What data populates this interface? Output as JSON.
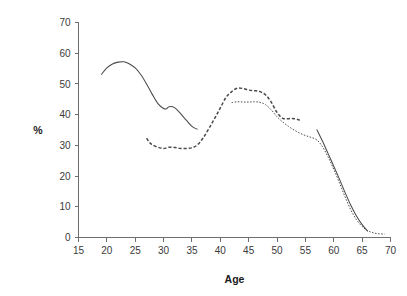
{
  "chart_data": {
    "type": "line",
    "title": "",
    "xlabel": "Age",
    "ylabel": "%",
    "xlim": [
      15,
      70
    ],
    "ylim": [
      0,
      70
    ],
    "xticks": [
      15,
      20,
      25,
      30,
      35,
      40,
      45,
      50,
      55,
      60,
      65,
      70
    ],
    "xticklabels": [
      "15",
      "20",
      "25",
      "30",
      "35",
      "40",
      "45",
      "50",
      "55",
      "60",
      "65",
      "70"
    ],
    "yticks": [
      0,
      10,
      20,
      30,
      40,
      50,
      60,
      70
    ],
    "yticklabels": [
      "0",
      "10",
      "20",
      "30",
      "40",
      "50",
      "60",
      "70"
    ],
    "grid": false,
    "legend": "none",
    "line_color": "#4a4a4a",
    "axis_color": "#6e6e6e",
    "series": [
      {
        "name": "solid-line",
        "style": "solid",
        "segments": [
          {
            "x": [
              19,
              20,
              21,
              22,
              23,
              24,
              25,
              26,
              27,
              28,
              29,
              30,
              30.5,
              31,
              32,
              33,
              34,
              35,
              36
            ],
            "y": [
              53.0,
              55.2,
              56.5,
              57.1,
              57.2,
              56.5,
              55.2,
              53.0,
              50.0,
              46.6,
              43.6,
              42.0,
              41.9,
              42.6,
              42.2,
              40.3,
              38.2,
              36.2,
              35.2
            ]
          },
          {
            "x": [
              57,
              58,
              59,
              60,
              61,
              62,
              63,
              64,
              65,
              66
            ],
            "y": [
              35.2,
              31.4,
              27.3,
              23.2,
              19.0,
              14.6,
              10.5,
              7.0,
              4.2,
              2.0
            ]
          }
        ]
      },
      {
        "name": "dashed-line",
        "style": "dashed",
        "segments": [
          {
            "x": [
              27,
              27.5,
              28,
              29,
              30,
              31,
              32,
              33,
              34,
              35,
              36,
              37,
              38,
              39,
              40,
              41,
              42,
              43,
              44,
              45,
              46,
              47,
              48,
              49,
              50,
              51,
              52,
              53,
              54
            ],
            "y": [
              32.3,
              31.0,
              30.2,
              29.4,
              29.0,
              29.4,
              29.3,
              29.0,
              29.0,
              29.2,
              30.2,
              32.5,
              35.5,
              38.8,
              42.2,
              45.6,
              47.5,
              48.6,
              48.5,
              48.0,
              47.8,
              47.5,
              46.4,
              44.0,
              40.7,
              38.8,
              38.7,
              38.7,
              38.2
            ]
          }
        ]
      },
      {
        "name": "dotted-line",
        "style": "dotted",
        "segments": [
          {
            "x": [
              42,
              43,
              44,
              45,
              46,
              47,
              48,
              49,
              50,
              51,
              52,
              53,
              54,
              55,
              56,
              57,
              58,
              59,
              60,
              61,
              62,
              63,
              64,
              65,
              66,
              67,
              68,
              69
            ],
            "y": [
              43.9,
              44.2,
              44.1,
              44.1,
              44.2,
              44.0,
              43.2,
              41.5,
              39.3,
              37.6,
              36.2,
              35.0,
              34.0,
              33.2,
              32.6,
              31.8,
              29.6,
              26.2,
              22.2,
              17.8,
              13.2,
              9.0,
              5.8,
              3.6,
              2.2,
              1.5,
              1.2,
              1.1
            ]
          }
        ]
      }
    ]
  }
}
